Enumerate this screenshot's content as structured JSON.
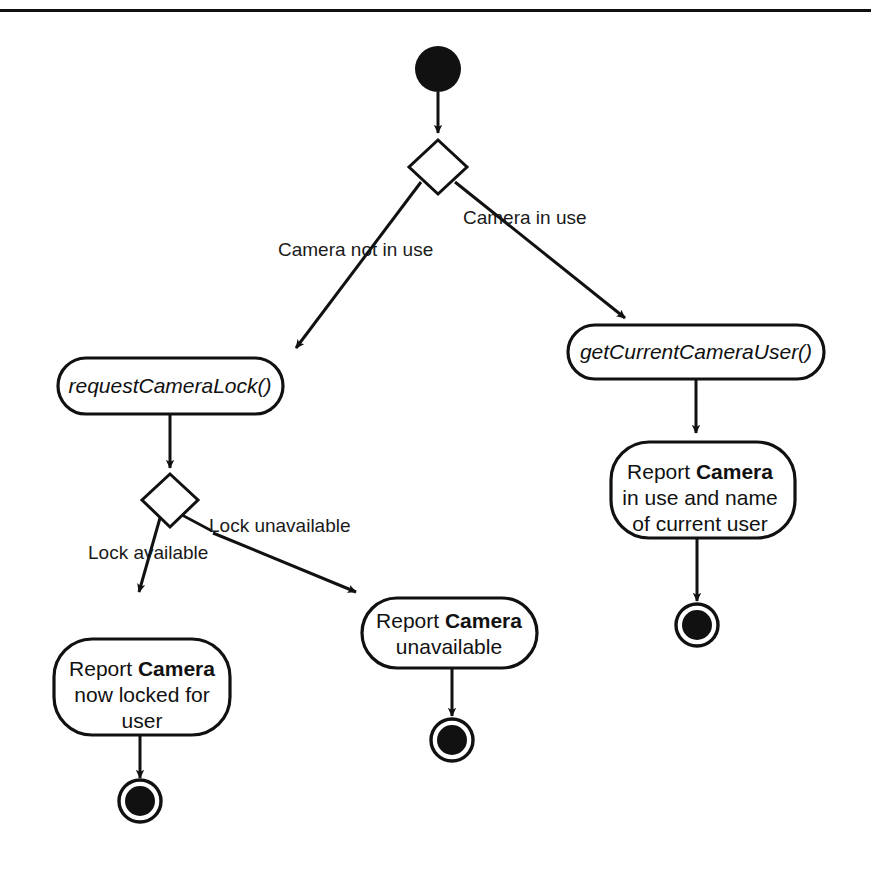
{
  "diagram": {
    "type": "uml-activity-diagram",
    "colors": {
      "stroke": "#111111",
      "fill": "#ffffff",
      "text": "#1a1a1a"
    },
    "start_node": {
      "name": "start"
    },
    "decisions": [
      {
        "id": "camera-in-use-decision"
      },
      {
        "id": "lock-availability-decision"
      }
    ],
    "edge_labels": {
      "camera_not_in_use": "Camera not in use",
      "camera_in_use": "Camera in use",
      "lock_available": "Lock available",
      "lock_unavailable": "Lock unavailable"
    },
    "activities": {
      "request_camera_lock": "requestCameraLock()",
      "get_current_camera_user": "getCurrentCameraUser()"
    },
    "reports": {
      "camera_in_use": {
        "line1_prefix": "Report ",
        "line1_bold": "Camera",
        "line2": "in use and name",
        "line3": "of current user"
      },
      "camera_unavailable": {
        "line1_prefix": "Report ",
        "line1_bold": "Camera",
        "line2": "unavailable"
      },
      "camera_now_locked": {
        "line1_prefix": "Report ",
        "line1_bold": "Camera",
        "line2": "now locked for",
        "line3": "user"
      }
    },
    "end_nodes": [
      {
        "id": "end-locked"
      },
      {
        "id": "end-unavailable"
      },
      {
        "id": "end-in-use"
      }
    ]
  }
}
